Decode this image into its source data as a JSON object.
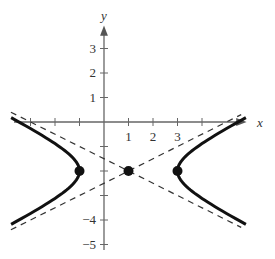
{
  "chart_data": {
    "type": "line",
    "title": "",
    "xlabel": "x",
    "ylabel": "y",
    "xlim": [
      -4.2,
      5.6
    ],
    "ylim": [
      -5.6,
      4.3
    ],
    "grid": false,
    "equation": "(x-1)^2/4 - (y+2)^2/1 = 1",
    "x_ticks": [
      -3,
      -2,
      -1,
      1,
      2,
      3,
      4
    ],
    "x_tick_labels": [
      "1",
      "2",
      "3"
    ],
    "x_tick_label_values": [
      1,
      2,
      3
    ],
    "y_ticks": [
      -5,
      -4,
      -3,
      -2,
      -1,
      1,
      2,
      3
    ],
    "y_tick_labels": [
      "3",
      "2",
      "1",
      "-4",
      "-5"
    ],
    "y_tick_label_values": [
      3,
      2,
      1,
      -4,
      -5
    ],
    "series": [
      {
        "name": "hyperbola-left-branch",
        "style": "solid-thick",
        "center": [
          1,
          -2
        ],
        "a": 2,
        "b": 1,
        "branch": "left"
      },
      {
        "name": "hyperbola-right-branch",
        "style": "solid-thick",
        "center": [
          1,
          -2
        ],
        "a": 2,
        "b": 1,
        "branch": "right"
      },
      {
        "name": "asymptote-1",
        "style": "dashed",
        "slope": 0.5,
        "through": [
          1,
          -2
        ]
      },
      {
        "name": "asymptote-2",
        "style": "dashed",
        "slope": -0.5,
        "through": [
          1,
          -2
        ]
      }
    ],
    "points": [
      {
        "name": "vertex-left",
        "x": -1,
        "y": -2
      },
      {
        "name": "center",
        "x": 1,
        "y": -2
      },
      {
        "name": "vertex-right",
        "x": 3,
        "y": -2
      }
    ]
  },
  "labels": {
    "x_axis": "x",
    "y_axis": "y"
  }
}
